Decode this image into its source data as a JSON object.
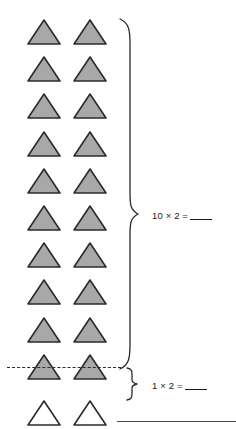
{
  "worksheet": {
    "title": "Multiplication array worksheet",
    "groups": [
      {
        "id": "filled-group",
        "rows": 10,
        "columns": 2,
        "shape": "triangle",
        "fill": "#a8a8a8",
        "stroke": "#2b2b2b",
        "equation": {
          "factor_a": "10",
          "operator": "×",
          "factor_b": "2",
          "equals": "=",
          "answer": ""
        },
        "equation_text": "10 × 2 ="
      },
      {
        "id": "unfilled-group",
        "rows": 1,
        "columns": 2,
        "shape": "triangle",
        "fill": "#ffffff",
        "stroke": "#2b2b2b",
        "equation": {
          "factor_a": "1",
          "operator": "×",
          "factor_b": "2",
          "equals": "=",
          "answer": ""
        },
        "equation_text": "1 × 2 ="
      }
    ],
    "separator": {
      "style": "dashed",
      "color": "#2a2a2a"
    },
    "bottom_rule": {
      "style": "solid",
      "color": "#4a4a4a"
    }
  }
}
